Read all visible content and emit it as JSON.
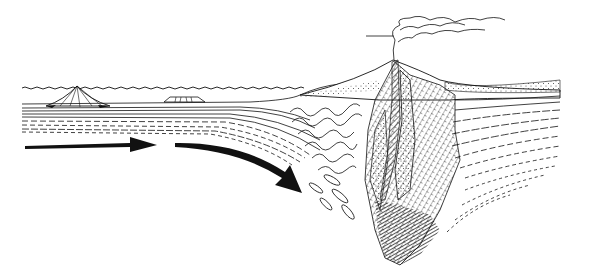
{
  "diagram": {
    "colors": {
      "background": "#ffffff",
      "ink": "#111111",
      "dark_fill": "#333333",
      "hatch": "#444444"
    },
    "elements": [
      {
        "name": "sea-surface",
        "type": "wavy-line"
      },
      {
        "name": "seamount-volcano",
        "type": "cone"
      },
      {
        "name": "flat-topped-guyot",
        "type": "plateau"
      },
      {
        "name": "oceanic-plate-layers",
        "type": "strata"
      },
      {
        "name": "plate-motion-arrow-straight",
        "type": "arrow"
      },
      {
        "name": "plate-motion-arrow-curved",
        "type": "arrow"
      },
      {
        "name": "accretionary-wedge-folds",
        "type": "folded-strata"
      },
      {
        "name": "volcanic-arc-erupting",
        "type": "volcano"
      },
      {
        "name": "eruption-plume",
        "type": "smoke"
      },
      {
        "name": "magma-chamber",
        "type": "intrusion"
      },
      {
        "name": "continental-crust-layers",
        "type": "strata"
      }
    ]
  }
}
